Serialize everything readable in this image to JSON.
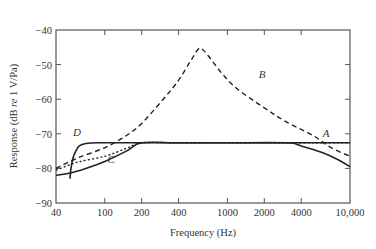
{
  "chart_data": {
    "type": "line",
    "title": "",
    "xlabel": "Frequency (Hz)",
    "ylabel_parts": [
      "Response (dB ",
      "re",
      " 1 V/Pa)"
    ],
    "ylabel": "Response (dB re 1 V/Pa)",
    "xscale": "log",
    "xlim": [
      40,
      10000
    ],
    "ylim": [
      -90,
      -40
    ],
    "grid": false,
    "legend": "inline curve labels",
    "x_ticks": [
      {
        "value": 40,
        "label": "40"
      },
      {
        "value": 100,
        "label": "100"
      },
      {
        "value": 200,
        "label": "200"
      },
      {
        "value": 400,
        "label": "400"
      },
      {
        "value": 1000,
        "label": "1000"
      },
      {
        "value": 2000,
        "label": "2000"
      },
      {
        "value": 4000,
        "label": "4000"
      },
      {
        "value": 10000,
        "label": "10,000"
      }
    ],
    "y_ticks": [
      {
        "value": -40,
        "label": "−40"
      },
      {
        "value": -50,
        "label": "−50"
      },
      {
        "value": -60,
        "label": "−60"
      },
      {
        "value": -70,
        "label": "−70"
      },
      {
        "value": -80,
        "label": "−80"
      },
      {
        "value": -90,
        "label": "−90"
      }
    ],
    "series": [
      {
        "name": "A",
        "style": "dotted",
        "label_pos": {
          "x": 6000,
          "y": -71
        },
        "points": [
          [
            40,
            -80.5
          ],
          [
            60,
            -78.2
          ],
          [
            100,
            -76.5
          ],
          [
            150,
            -74.2
          ],
          [
            200,
            -72.6
          ],
          [
            400,
            -72.6
          ],
          [
            1000,
            -72.6
          ],
          [
            3000,
            -72.6
          ],
          [
            10000,
            -72.6
          ]
        ]
      },
      {
        "name": "B",
        "style": "dashed",
        "label_pos": {
          "x": 1800,
          "y": -54
        },
        "points": [
          [
            40,
            -80
          ],
          [
            60,
            -77
          ],
          [
            100,
            -74
          ],
          [
            150,
            -70.5
          ],
          [
            200,
            -67
          ],
          [
            300,
            -60
          ],
          [
            400,
            -54.5
          ],
          [
            500,
            -49
          ],
          [
            580,
            -45.5
          ],
          [
            620,
            -45.5
          ],
          [
            700,
            -47.5
          ],
          [
            900,
            -52.5
          ],
          [
            1200,
            -57
          ],
          [
            2000,
            -62.5
          ],
          [
            3000,
            -66.5
          ],
          [
            5000,
            -70.5
          ],
          [
            7000,
            -74
          ],
          [
            10000,
            -76.5
          ]
        ]
      },
      {
        "name": "C",
        "style": "solid",
        "label_pos": {
          "x": 105,
          "y": -78.5
        },
        "points": [
          [
            40,
            -82
          ],
          [
            50,
            -81.5
          ],
          [
            70,
            -80
          ],
          [
            100,
            -78
          ],
          [
            150,
            -75
          ],
          [
            200,
            -72.6
          ],
          [
            400,
            -72.6
          ],
          [
            1000,
            -72.6
          ],
          [
            3000,
            -72.6
          ],
          [
            4000,
            -73.5
          ],
          [
            6000,
            -75.5
          ],
          [
            8000,
            -77.5
          ],
          [
            10000,
            -79.5
          ]
        ]
      },
      {
        "name": "D",
        "style": "solid",
        "label_pos": {
          "x": 55,
          "y": -70.5
        },
        "points": [
          [
            52,
            -83
          ],
          [
            53,
            -80
          ],
          [
            55,
            -77
          ],
          [
            58,
            -75
          ],
          [
            62,
            -73.5
          ],
          [
            70,
            -72.8
          ],
          [
            90,
            -72.6
          ],
          [
            200,
            -72.6
          ],
          [
            1000,
            -72.6
          ],
          [
            3000,
            -72.6
          ],
          [
            10000,
            -72.6
          ]
        ]
      }
    ]
  }
}
